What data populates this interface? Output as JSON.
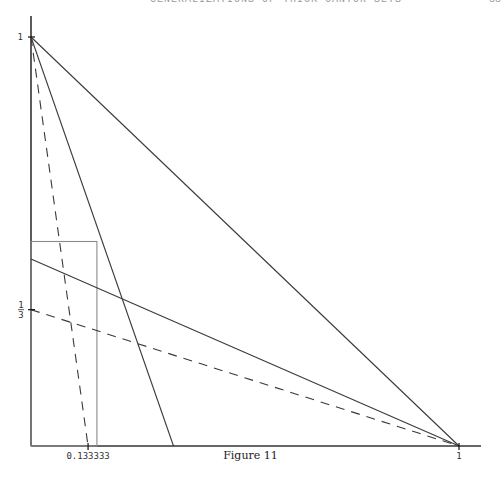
{
  "header": {
    "running_head": "GENERALIZATIONS OF THICK CANTOR SETS",
    "page_number": "33"
  },
  "caption": "Figure 11",
  "chart_data": {
    "type": "line",
    "title": "Figure 11",
    "xlabel": "",
    "ylabel": "",
    "xlim": [
      0,
      1.05
    ],
    "ylim": [
      0,
      1.05
    ],
    "grid": false,
    "x_ticks": [
      {
        "value": 0.133333,
        "label": "0.133333"
      },
      {
        "value": 1,
        "label": "1"
      }
    ],
    "y_ticks": [
      {
        "value": 1,
        "label": "1"
      },
      {
        "value": 0.333333,
        "label": "1/3"
      }
    ],
    "series": [
      {
        "name": "diagonal",
        "style": "solid",
        "points": [
          [
            0,
            1
          ],
          [
            1,
            0
          ]
        ]
      },
      {
        "name": "steep-line",
        "style": "solid",
        "points": [
          [
            0,
            1
          ],
          [
            0.333,
            0
          ]
        ]
      },
      {
        "name": "dashed-steep-line",
        "style": "dashed",
        "points": [
          [
            0,
            1
          ],
          [
            0.133333,
            0
          ]
        ]
      },
      {
        "name": "shallow-line",
        "style": "solid",
        "points": [
          [
            0,
            0.457
          ],
          [
            1,
            0
          ]
        ]
      },
      {
        "name": "dashed-shallow-line",
        "style": "dashed",
        "points": [
          [
            0,
            0.333333
          ],
          [
            1,
            0
          ]
        ]
      }
    ],
    "rectangles": [
      {
        "name": "box",
        "x0": 0,
        "y0": 0,
        "x1": 0.154,
        "y1": 0.5,
        "style": "solid-gray"
      }
    ],
    "colors": {
      "axis": "#333333",
      "line": "#3a3a3a",
      "box": "#8a8a8a"
    }
  }
}
